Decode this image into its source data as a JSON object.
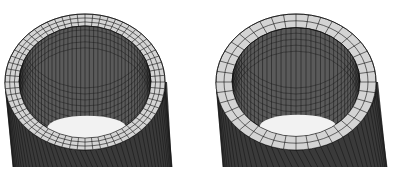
{
  "figure": {
    "panels": [
      {
        "id": "left",
        "description": "Finite element mesh of hollow cylinder, fine mesh",
        "ring_divisions": 64,
        "radial_divisions": 3,
        "wall_divisions": 48
      },
      {
        "id": "right",
        "description": "Finite element mesh of hollow cylinder, coarser mesh",
        "ring_divisions": 40,
        "radial_divisions": 2,
        "wall_divisions": 40
      }
    ],
    "colors": {
      "background": "#ffffff",
      "top_face": "#d4d4d4",
      "inner_wall": "#5a5a5a",
      "outer_wall": "#3a3a3a",
      "mesh_lines": "#111111",
      "hole": "#f2f2f2"
    }
  }
}
